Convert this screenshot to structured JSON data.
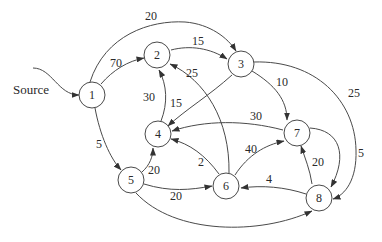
{
  "diagram": {
    "type": "directed-weighted-graph",
    "source_label": "Source",
    "nodes": [
      {
        "id": "1",
        "label": "1"
      },
      {
        "id": "2",
        "label": "2"
      },
      {
        "id": "3",
        "label": "3"
      },
      {
        "id": "4",
        "label": "4"
      },
      {
        "id": "5",
        "label": "5"
      },
      {
        "id": "6",
        "label": "6"
      },
      {
        "id": "7",
        "label": "7"
      },
      {
        "id": "8",
        "label": "8"
      }
    ],
    "edges": [
      {
        "from": "1",
        "to": "2",
        "weight": "70"
      },
      {
        "from": "1",
        "to": "3",
        "weight": "20"
      },
      {
        "from": "1",
        "to": "5",
        "weight": "5"
      },
      {
        "from": "2",
        "to": "3",
        "weight": "15"
      },
      {
        "from": "3",
        "to": "4",
        "weight": "15"
      },
      {
        "from": "3",
        "to": "7",
        "weight": "10"
      },
      {
        "from": "3",
        "to": "8",
        "weight": "25"
      },
      {
        "from": "4",
        "to": "2",
        "weight": "30"
      },
      {
        "from": "5",
        "to": "4",
        "weight": "20"
      },
      {
        "from": "5",
        "to": "6",
        "weight": "20"
      },
      {
        "from": "5",
        "to": "8",
        "weight": ""
      },
      {
        "from": "6",
        "to": "2",
        "weight": "25"
      },
      {
        "from": "6",
        "to": "4",
        "weight": "2"
      },
      {
        "from": "6",
        "to": "7",
        "weight": "40"
      },
      {
        "from": "7",
        "to": "4",
        "weight": "30"
      },
      {
        "from": "7",
        "to": "8",
        "weight": "5"
      },
      {
        "from": "8",
        "to": "6",
        "weight": "4"
      },
      {
        "from": "8",
        "to": "7",
        "weight": "20"
      }
    ]
  }
}
